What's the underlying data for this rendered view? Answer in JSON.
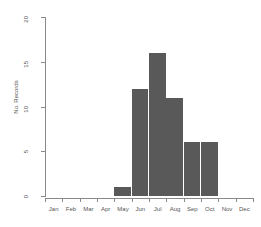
{
  "chart_data": {
    "type": "bar",
    "title": "",
    "subtitle": "",
    "xlabel": "",
    "ylabel": "No. Records",
    "categories": [
      "Jan",
      "Feb",
      "Mar",
      "Apr",
      "May",
      "Jun",
      "Jul",
      "Aug",
      "Sep",
      "Oct",
      "Nov",
      "Dec"
    ],
    "values": [
      0,
      0,
      0,
      0,
      1,
      12,
      16,
      11,
      6,
      6,
      0,
      0
    ],
    "ylim": [
      0,
      20
    ],
    "yticks": [
      0,
      5,
      10,
      15,
      20
    ],
    "ytick_labels": [
      "0",
      "5",
      "10",
      "15",
      "20"
    ],
    "grid": false,
    "legend": null,
    "bar_color": "#595959",
    "axis_color": "#8a8a8a",
    "text_color": "#555555",
    "background": "#ffffff"
  },
  "axes": {
    "y_title": "No. Records"
  }
}
